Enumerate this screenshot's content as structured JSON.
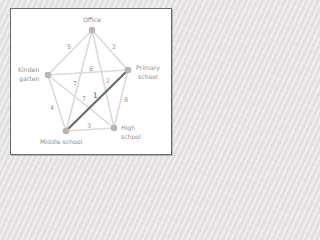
{
  "diagram": {
    "type": "weighted-graph",
    "nodes": [
      {
        "id": "office",
        "label": [
          "Office"
        ],
        "x": 92,
        "y": 30
      },
      {
        "id": "kindergarten",
        "label": [
          "Kinden",
          "garten"
        ],
        "x": 48,
        "y": 75
      },
      {
        "id": "primary",
        "label": [
          "Primary",
          "school"
        ],
        "x": 128,
        "y": 70
      },
      {
        "id": "middle",
        "label": [
          "Middle school"
        ],
        "x": 66,
        "y": 131
      },
      {
        "id": "high",
        "label": [
          "High",
          "school"
        ],
        "x": 114,
        "y": 128
      }
    ],
    "edges": [
      {
        "from": "office",
        "to": "kindergarten",
        "weight": "5",
        "highlight": false
      },
      {
        "from": "office",
        "to": "primary",
        "weight": "2",
        "highlight": false
      },
      {
        "from": "kindergarten",
        "to": "primary",
        "weight": "6",
        "highlight": false
      },
      {
        "from": "office",
        "to": "middle",
        "weight": "7",
        "highlight": false
      },
      {
        "from": "office",
        "to": "high",
        "weight": "2",
        "highlight": false
      },
      {
        "from": "kindergarten",
        "to": "high",
        "weight": "7",
        "highlight": false
      },
      {
        "from": "kindergarten",
        "to": "middle",
        "weight": "4",
        "highlight": false
      },
      {
        "from": "primary",
        "to": "middle",
        "weight": "1",
        "highlight": true
      },
      {
        "from": "primary",
        "to": "high",
        "weight": "8",
        "highlight": false
      },
      {
        "from": "middle",
        "to": "high",
        "weight": "3",
        "highlight": false
      }
    ],
    "colors": {
      "edge": "#e0d8d8",
      "highlight_edge": "#6b6b6b",
      "node": "#b7b7b7",
      "label": "#8e8e8e"
    }
  },
  "labels": {
    "office": "Office",
    "kindergarten_1": "Kinden",
    "kindergarten_2": "garten",
    "primary_1": "Primary",
    "primary_2": "school",
    "middle": "Middle school",
    "high_1": "High",
    "high_2": "school",
    "w_office_kindergarten": "5",
    "w_office_primary": "2",
    "w_kindergarten_primary": "6",
    "w_office_middle": "7",
    "w_office_high": "2",
    "w_kindergarten_high": "7",
    "w_kindergarten_middle": "4",
    "w_primary_middle": "1",
    "w_primary_high": "8",
    "w_middle_high": "3"
  }
}
